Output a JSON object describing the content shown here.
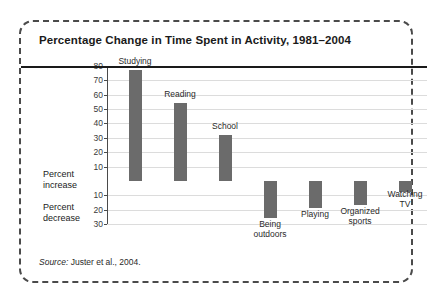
{
  "figure": {
    "title": "Percentage Change in Time Spent in Activity, 1981–2004",
    "source_prefix": "Source:",
    "source_text": " Juster et al., 2004.",
    "axis_caption_increase": "Percent\nincrease",
    "axis_caption_decrease": "Percent\ndecrease",
    "bar_color": "#6b6b6b",
    "gridline_color": "#dcdcdc",
    "axis_color": "#1a1a1a",
    "border_color": "#4a4a4a"
  },
  "chart_data": {
    "type": "bar",
    "title": "Percentage Change in Time Spent in Activity, 1981–2004",
    "xlabel": "",
    "ylabel": "Percent increase / Percent decrease",
    "ylim": [
      -30,
      80
    ],
    "grid": true,
    "legend": "none",
    "orientation": "vertical",
    "zero_baseline": true,
    "tick_values": [
      80,
      70,
      60,
      50,
      40,
      30,
      20,
      10,
      0,
      -10,
      -20,
      -30
    ],
    "tick_labels": [
      "80",
      "70",
      "60",
      "50",
      "40",
      "30",
      "20",
      "10",
      "",
      "10",
      "20",
      "30"
    ],
    "categories": [
      "Studying",
      "Reading",
      "School",
      "Being outdoors",
      "Playing",
      "Organized sports",
      "Watching TV"
    ],
    "category_display": [
      "Studying",
      "Reading",
      "School",
      "Being\noutdoors",
      "Playing",
      "Organized\nsports",
      "Watching\nTV"
    ],
    "values": [
      77,
      54,
      32,
      -26,
      -19,
      -17,
      -8
    ],
    "annotations": [
      "Percent increase",
      "Percent decrease"
    ]
  }
}
